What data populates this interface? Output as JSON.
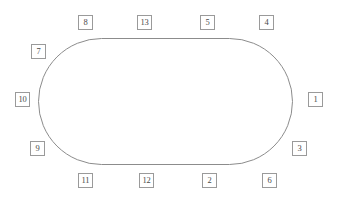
{
  "diagram": {
    "canvas": {
      "width": 338,
      "height": 202,
      "background": "#ffffff"
    },
    "shape": {
      "name": "oval",
      "type": "stadium",
      "stroke_color": "#8c8c8c",
      "stroke_width": 1,
      "fill": "none",
      "left": 38,
      "top": 38,
      "width": 255,
      "height": 127
    },
    "box_style": {
      "width": 15,
      "height": 15,
      "border_color": "#9a9a9a",
      "text_color": "#4a4a4a",
      "fill": "#ffffff"
    },
    "nodes": [
      {
        "label": "8",
        "x": 78,
        "y": 15,
        "position": "top"
      },
      {
        "label": "13",
        "x": 137,
        "y": 15,
        "position": "top"
      },
      {
        "label": "5",
        "x": 200,
        "y": 15,
        "position": "top"
      },
      {
        "label": "4",
        "x": 259,
        "y": 15,
        "position": "top"
      },
      {
        "label": "7",
        "x": 31,
        "y": 44,
        "position": "upper-left"
      },
      {
        "label": "10",
        "x": 15,
        "y": 92,
        "position": "left"
      },
      {
        "label": "1",
        "x": 308,
        "y": 92,
        "position": "right"
      },
      {
        "label": "9",
        "x": 30,
        "y": 141,
        "position": "lower-left"
      },
      {
        "label": "3",
        "x": 292,
        "y": 141,
        "position": "lower-right"
      },
      {
        "label": "11",
        "x": 78,
        "y": 173,
        "position": "bottom"
      },
      {
        "label": "12",
        "x": 139,
        "y": 173,
        "position": "bottom"
      },
      {
        "label": "2",
        "x": 202,
        "y": 173,
        "position": "bottom"
      },
      {
        "label": "6",
        "x": 262,
        "y": 173,
        "position": "bottom"
      }
    ]
  }
}
